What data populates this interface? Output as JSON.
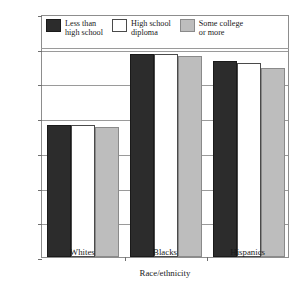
{
  "chart_data": {
    "type": "bar",
    "title": "",
    "xlabel": "Race/ethnicity",
    "ylabel": "Percentage underperforming students",
    "categories": [
      "Whites",
      "Blacks",
      "Hispanics"
    ],
    "ylim": [
      0,
      70
    ],
    "yticks": [
      0,
      10,
      20,
      30,
      40,
      50,
      60,
      70
    ],
    "grid": "horizontal",
    "legend_position": "top-inside",
    "series": [
      {
        "name": "Less than high school",
        "color": "#2c2c2c",
        "values": [
          38,
          58.5,
          56.5
        ]
      },
      {
        "name": "High school diploma",
        "color": "#ffffff",
        "values": [
          38,
          58.5,
          56
        ]
      },
      {
        "name": "Some college or more",
        "color": "#bdbdbd",
        "values": [
          37.5,
          58,
          54.5
        ]
      }
    ]
  },
  "axis": {
    "y_tick_labels": [
      "0",
      "10",
      "20",
      "30",
      "40",
      "50",
      "60",
      "70"
    ],
    "y_title": "Percentage underperforming students",
    "x_title": "Race/ethnicity",
    "x_tick_labels": [
      "Whites",
      "Blacks",
      "Hispanics"
    ]
  },
  "legend": {
    "items": [
      {
        "label": "Less than\nhigh school",
        "swatch": "dark-swatch"
      },
      {
        "label": "High school\ndiploma",
        "swatch": "white-swatch"
      },
      {
        "label": "Some college\nor more",
        "swatch": "gray-swatch"
      }
    ]
  }
}
